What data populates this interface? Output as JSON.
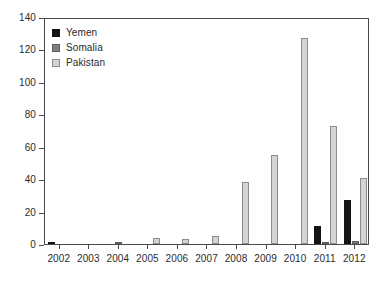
{
  "chart_data": {
    "type": "bar",
    "title": "",
    "xlabel": "",
    "ylabel": "",
    "grid": false,
    "legend_position": "top-left",
    "ylim": [
      0,
      140
    ],
    "yticks": [
      0,
      20,
      40,
      60,
      80,
      100,
      120,
      140
    ],
    "ytick_labels": [
      "0",
      "20",
      "40",
      "60",
      "80",
      "100",
      "120",
      "140"
    ],
    "categories": [
      "2002",
      "2003",
      "2004",
      "2005",
      "2006",
      "2007",
      "2008",
      "2009",
      "2010",
      "2011",
      "2012"
    ],
    "series": [
      {
        "name": "Yemen",
        "color": "#141414",
        "values": [
          1,
          0,
          0,
          0,
          0,
          0,
          0,
          0,
          0,
          11,
          27
        ]
      },
      {
        "name": "Somalia",
        "color": "#7d7d7d",
        "values": [
          0,
          0,
          1,
          0,
          0,
          0,
          0,
          0,
          0,
          1,
          2
        ]
      },
      {
        "name": "Pakistan",
        "color": "#d4d4d4",
        "values": [
          0,
          0,
          0,
          4,
          3,
          5,
          38,
          55,
          127,
          73,
          41
        ]
      }
    ]
  },
  "legend": {
    "items": [
      {
        "label": "Yemen",
        "swatch": "yemen-swatch"
      },
      {
        "label": "Somalia",
        "swatch": "somalia-swatch"
      },
      {
        "label": "Pakistan",
        "swatch": "pakistan-swatch"
      }
    ]
  }
}
